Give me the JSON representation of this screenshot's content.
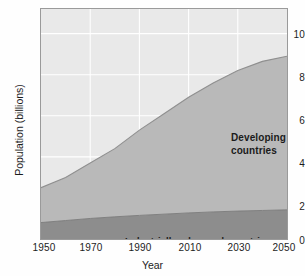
{
  "chart_data": {
    "type": "area",
    "title": "",
    "xlabel": "Year",
    "ylabel": "Population (billions)",
    "xlim": [
      1950,
      2050
    ],
    "ylim": [
      0,
      11.2
    ],
    "xticks": [
      1950,
      1970,
      1990,
      2010,
      2030,
      2050
    ],
    "yticks": [
      0,
      2,
      4,
      6,
      8,
      10
    ],
    "grid": true,
    "stacked": true,
    "legend_position": "in-plot annotations",
    "x": [
      1950,
      1960,
      1970,
      1980,
      1990,
      2000,
      2010,
      2020,
      2030,
      2040,
      2050
    ],
    "series": [
      {
        "name": "Industrially advanced countries",
        "color": "#8d8d8d",
        "values": [
          0.8,
          0.9,
          1.0,
          1.08,
          1.15,
          1.21,
          1.27,
          1.32,
          1.36,
          1.39,
          1.42
        ]
      },
      {
        "name": "Developing countries",
        "color": "#b9b9b9",
        "values": [
          1.7,
          2.1,
          2.7,
          3.32,
          4.15,
          4.89,
          5.63,
          6.28,
          6.84,
          7.26,
          7.48
        ]
      }
    ],
    "totals": [
      2.5,
      3.0,
      3.7,
      4.4,
      5.3,
      6.1,
      6.9,
      7.6,
      8.2,
      8.65,
      8.9
    ],
    "background_color": "#e9e9e9",
    "gridline_color": "#ffffff",
    "frame_color": "#9a9a9a"
  },
  "axes": {
    "y_title": "Population (billions)",
    "x_title": "Year",
    "y_tick_labels": [
      "10",
      "8",
      "6",
      "4",
      "2",
      "0"
    ],
    "x_tick_labels": [
      "1950",
      "1970",
      "1990",
      "2010",
      "2030",
      "2050"
    ]
  },
  "annotations": {
    "developing_line1": "Developing",
    "developing_line2": "countries",
    "industrial": "Industrially advanced countries"
  }
}
